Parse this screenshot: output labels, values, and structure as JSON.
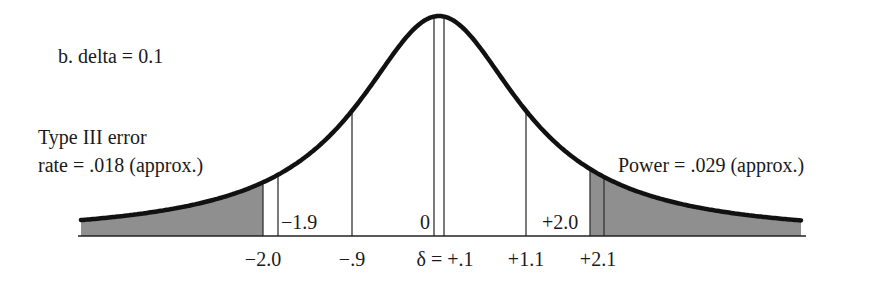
{
  "panel_label": "b. delta = 0.1",
  "annotations": {
    "left_line1": "Type III error",
    "left_line2": "rate = .018 (approx.)",
    "right": "Power = .029 (approx.)"
  },
  "markers": {
    "minus_1_9": "−1.9",
    "zero": "0",
    "plus_2_0": "+2.0"
  },
  "axis_ticks": {
    "minus_2_0": "−2.0",
    "minus_0_9": "−.9",
    "delta": "δ = +.1",
    "plus_1_1": "+1.1",
    "plus_2_1": "+2.1"
  },
  "colors": {
    "curve": "#111111",
    "shade": "#8f8f8f",
    "line": "#333333"
  },
  "chart_data": {
    "type": "area",
    "title": "b. delta = 0.1",
    "center": 0.1,
    "critical_values": [
      -2.0,
      2.0
    ],
    "reference_lines": [
      -2.0,
      -1.9,
      -0.9,
      0,
      0.1,
      1.1,
      2.0,
      2.1
    ],
    "tick_labels": [
      "−2.0",
      "−.9",
      "δ = +.1",
      "+1.1",
      "+2.1"
    ],
    "inner_labels": [
      "−1.9",
      "0",
      "+2.0"
    ],
    "shaded_regions": [
      {
        "name": "Type III error rate",
        "from": "-inf",
        "to": -2.0,
        "value": 0.018
      },
      {
        "name": "Power",
        "from": 2.0,
        "to": "+inf",
        "value": 0.029
      }
    ],
    "annotations": [
      "Type III error rate = .018 (approx.)",
      "Power = .029 (approx.)"
    ]
  },
  "geometry": {
    "baseline_y": 236,
    "x_start": 81,
    "x_end": 801,
    "center_x": 439,
    "peak_height": 220,
    "gamma": 100,
    "left_shade_end_x": 263,
    "right_shade_start_x": 590,
    "lines_x": [
      263,
      278,
      352,
      434,
      444,
      526,
      590,
      604
    ]
  }
}
